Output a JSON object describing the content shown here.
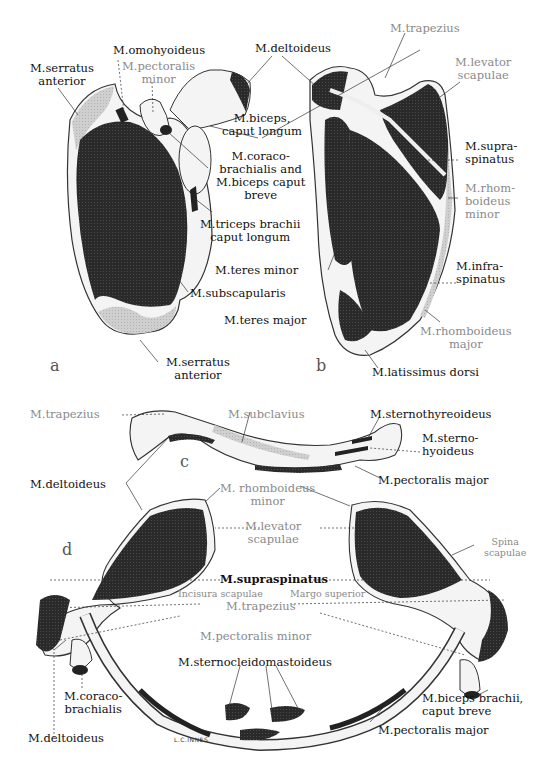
{
  "figure": {
    "signature": "L.C.INNES",
    "panels": {
      "a": {
        "letter": "a",
        "labels": {
          "serratus_anterior_top": "M.serratus\nanterior",
          "omohyoideus": "M.omohyoideus",
          "pectoralis_minor": "M.pectoralis\nminor",
          "deltoideus": "M.deltoideus",
          "biceps_caput_longum": "M.biceps,\ncaput longum",
          "coracobrachialis_biceps_breve": "M.coraco-\nbrachialis and\nM.biceps caput\nbreve",
          "triceps_caput_longum": "M.triceps brachii\ncaput longum",
          "subscapularis": "M.subscapularis",
          "serratus_anterior_bottom": "M.serratus\nanterior"
        }
      },
      "b": {
        "letter": "b",
        "labels": {
          "trapezius": "M.trapezius",
          "levator_scapulae": "M.levator\nscapulae",
          "supraspinatus": "M.supra-\nspinatus",
          "rhomboideus_minor": "M.rhom-\nboideus\nminor",
          "teres_minor": "M.teres minor",
          "infraspinatus": "M.infra-\nspinatus",
          "teres_major": "M.teres major",
          "rhomboideus_major": "M.rhomboideus\nmajor",
          "latissimus_dorsi": "M.latissimus dorsi"
        }
      },
      "c": {
        "letter": "c",
        "labels": {
          "trapezius": "M.trapezius",
          "subclavius": "M.subclavius",
          "sternothyreoideus": "M.sternothyreoideus",
          "sternohyoideus": "M.sterno-\nhyoideus",
          "deltoideus": "M.deltoideus",
          "pectoralis_major": "M.pectoralis major"
        }
      },
      "d": {
        "letter": "d",
        "labels": {
          "rhomboideus_minor": "M. rhomboideus\nminor",
          "levator_scapulae": "M.levator\nscapulae",
          "spina_scapulae": "Spina\nscapulae",
          "supraspinatus": "M.supraspinatus",
          "incisura_scapulae": "Incisura scapulae",
          "margo_superior": "Margo superior",
          "trapezius": "M.trapezius",
          "pectoralis_minor": "M.pectoralis minor",
          "coracobrachialis": "M.coraco-\nbrachialis",
          "sternocleidomastoideus": "M.sternocleidomastoideus",
          "biceps_caput_breve": "M.biceps brachii,\ncaput breve",
          "deltoideus": "M.deltoideus",
          "pectoralis_major": "M.pectoralis major"
        }
      }
    },
    "colors": {
      "muscle_dark": "#2a2a2a",
      "muscle_light": "#c8c8c8",
      "bone": "#f4f4f4",
      "outline": "#333333",
      "label_black": "#111111",
      "label_gray": "#8a8a8a"
    }
  }
}
